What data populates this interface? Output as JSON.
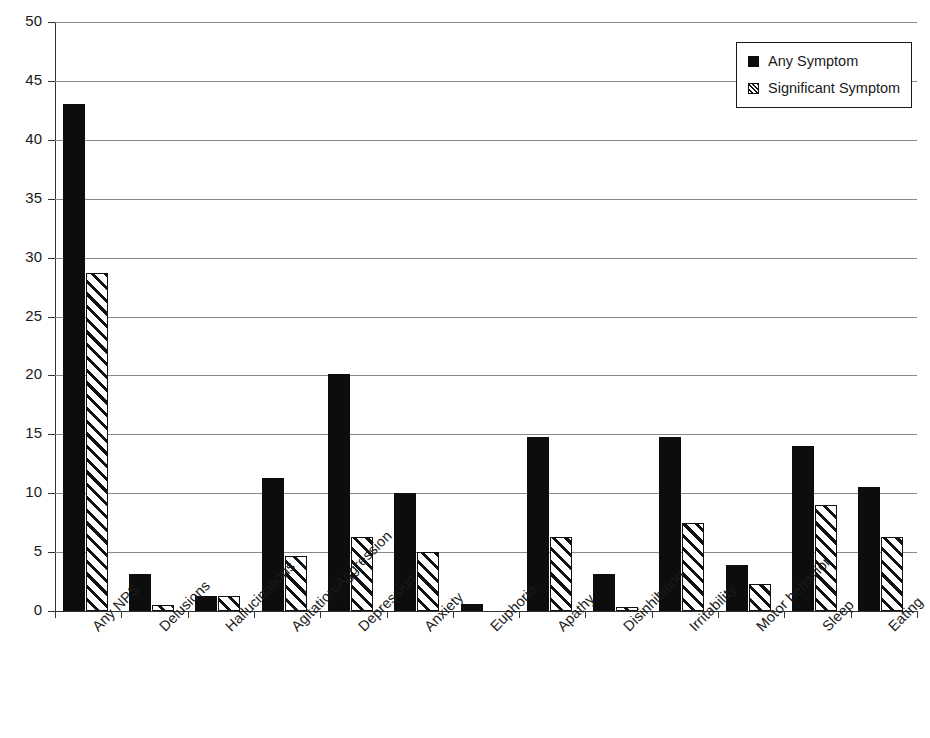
{
  "chart_data": {
    "type": "bar",
    "title": "",
    "xlabel": "",
    "ylabel": "",
    "ylim": [
      0,
      50
    ],
    "ytick_step": 5,
    "yticks": [
      "0",
      "5",
      "10",
      "15",
      "20",
      "25",
      "30",
      "35",
      "40",
      "45",
      "50"
    ],
    "grid": true,
    "legend_position": "top-right",
    "categories": [
      "Any NPS",
      "Delusions",
      "Hallucinations",
      "Agitation/Aggression",
      "Depression",
      "Anxiety",
      "Euphoria",
      "Apathy",
      "Disinhibition",
      "Irritability",
      "Motor behavior",
      "Sleep",
      "Eating"
    ],
    "series": [
      {
        "name": "Any Symptom",
        "style": "solid-black",
        "color": "#0d0d0d",
        "values": [
          43.0,
          3.1,
          1.3,
          11.3,
          20.1,
          10.0,
          0.6,
          14.8,
          3.1,
          14.8,
          3.9,
          14.0,
          10.5
        ]
      },
      {
        "name": "Significant Symptom",
        "style": "diagonal-hatch",
        "color": "#111111",
        "values": [
          28.7,
          0.5,
          1.3,
          4.7,
          6.3,
          5.0,
          0.0,
          6.3,
          0.3,
          7.5,
          2.3,
          9.0,
          6.3
        ]
      }
    ]
  },
  "legend": {
    "items": [
      {
        "label": "Any Symptom",
        "swatch": "solid-black-square-icon"
      },
      {
        "label": "Significant Symptom",
        "swatch": "hatched-square-icon"
      }
    ]
  }
}
